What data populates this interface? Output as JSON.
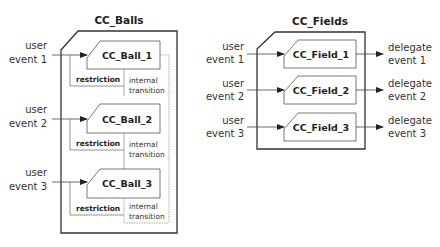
{
  "left": {
    "title": "CC_Balls",
    "components": [
      {
        "name": "CC_Ball_1",
        "input": [
          "user",
          "event 1"
        ],
        "restriction": "restriction",
        "transition": [
          "internal",
          "transition"
        ]
      },
      {
        "name": "CC_Ball_2",
        "input": [
          "user",
          "event 2"
        ],
        "restriction": "restriction",
        "transition": [
          "internal",
          "transition"
        ]
      },
      {
        "name": "CC_Ball_3",
        "input": [
          "user",
          "event 3"
        ],
        "restriction": "restriction",
        "transition": [
          "internal",
          "transition"
        ]
      }
    ]
  },
  "right": {
    "title": "CC_Fields",
    "components": [
      {
        "name": "CC_Field_1",
        "input": [
          "user",
          "event 1"
        ],
        "output": [
          "delegate",
          "event 1"
        ]
      },
      {
        "name": "CC_Field_2",
        "input": [
          "user",
          "event 2"
        ],
        "output": [
          "delegate",
          "event 2"
        ]
      },
      {
        "name": "CC_Field_3",
        "input": [
          "user",
          "event 3"
        ],
        "output": [
          "delegate",
          "event 3"
        ]
      }
    ]
  },
  "colors": {
    "stroke": "#333333",
    "thin": "#555555",
    "dotted": "#777777"
  }
}
